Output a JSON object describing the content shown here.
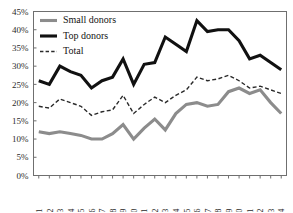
{
  "chart_data": {
    "type": "line",
    "title": "",
    "xlabel": "",
    "ylabel": "",
    "ylim": [
      0,
      45
    ],
    "ytick_values": [
      0,
      5,
      10,
      15,
      20,
      25,
      30,
      35,
      40,
      45
    ],
    "ytick_labels": [
      "0%",
      "5%",
      "10%",
      "15%",
      "20%",
      "25%",
      "30%",
      "35%",
      "40%",
      "45%"
    ],
    "grid": false,
    "legend_position": "top-left",
    "categories": [
      "1981",
      "1982",
      "1983",
      "1984",
      "1985",
      "1986",
      "1987",
      "1988",
      "1989",
      "1990",
      "1991",
      "1992",
      "1993",
      "1994",
      "1995",
      "1996",
      "1997",
      "1998",
      "1999",
      "2000",
      "2001",
      "2002",
      "2003",
      "2004"
    ],
    "series": [
      {
        "name": "Small donors",
        "color": "#8c8c8c",
        "style": "solid",
        "width": 3.1,
        "values": [
          12.0,
          11.5,
          12.0,
          11.5,
          11.0,
          10.0,
          10.0,
          11.5,
          14.0,
          10.0,
          13.0,
          15.5,
          12.5,
          17.0,
          19.5,
          20.0,
          19.0,
          19.5,
          23.0,
          24.0,
          22.5,
          23.5,
          20.0,
          17.0
        ]
      },
      {
        "name": "Top donors",
        "color": "#111111",
        "style": "solid",
        "width": 3.1,
        "values": [
          26.0,
          25.0,
          30.0,
          28.5,
          27.5,
          24.0,
          26.0,
          27.0,
          32.0,
          25.0,
          30.5,
          31.0,
          38.0,
          36.0,
          34.0,
          42.5,
          39.5,
          40.0,
          40.0,
          37.0,
          32.0,
          33.0,
          31.0,
          29.0
        ]
      },
      {
        "name": "Total",
        "color": "#2a2a2a",
        "style": "dashed",
        "width": 1.4,
        "values": [
          19.0,
          18.5,
          21.0,
          20.0,
          19.0,
          16.5,
          17.5,
          18.0,
          22.0,
          17.0,
          19.5,
          21.5,
          20.0,
          22.0,
          23.5,
          27.0,
          26.0,
          26.5,
          27.5,
          26.0,
          24.0,
          24.5,
          23.5,
          22.5
        ]
      }
    ]
  },
  "legend": {
    "items": [
      {
        "label": "Small donors"
      },
      {
        "label": "Top donors"
      },
      {
        "label": "Total"
      }
    ]
  }
}
